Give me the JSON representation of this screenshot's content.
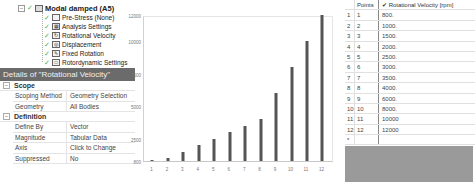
{
  "tree": {
    "root": {
      "label": "Modal damped (A5)",
      "icon": "folder-icon"
    },
    "items": [
      {
        "label": "Pre-Stress (None)",
        "icon": "prestress-icon"
      },
      {
        "label": "Analysis Settings",
        "icon": "analysis-settings-icon"
      },
      {
        "label": "Rotational Velocity",
        "icon": "rotational-velocity-icon"
      },
      {
        "label": "Displacement",
        "icon": "displacement-icon"
      },
      {
        "label": "Fixed Rotation",
        "icon": "fixed-rotation-icon"
      },
      {
        "label": "Rotordynamic Settings",
        "icon": "rotordynamic-settings-icon"
      }
    ]
  },
  "details": {
    "title": "Details of \"Rotational Velocity\"",
    "groups": [
      {
        "label": "Scope",
        "rows": [
          {
            "key": "Scoping Method",
            "value": "Geometry Selection"
          },
          {
            "key": "Geometry",
            "value": "All Bodies"
          }
        ]
      },
      {
        "label": "Definition",
        "rows": [
          {
            "key": "Define By",
            "value": "Vector"
          },
          {
            "key": "Magnitude",
            "value": "Tabular Data"
          },
          {
            "key": "Axis",
            "value": "Click to Change"
          },
          {
            "key": "Suppressed",
            "value": "No"
          }
        ]
      }
    ]
  },
  "chart_data": {
    "type": "bar",
    "title": "",
    "xlabel": "",
    "ylabel": "",
    "categories": [
      "1",
      "2",
      "3",
      "4",
      "5",
      "6",
      "7",
      "8",
      "9",
      "10",
      "11",
      "12"
    ],
    "values": [
      800,
      1000,
      1500,
      2000,
      2500,
      3000,
      3500,
      4000,
      6000,
      8000,
      10000,
      12000
    ],
    "yticks": [
      "12000",
      "10000",
      "7500",
      "5000",
      "2500",
      "800"
    ],
    "ylim": [
      800,
      12000
    ],
    "grid": false,
    "bar_color": "#555555"
  },
  "table": {
    "headers": [
      "",
      "Points",
      "✔ Rotational Velocity [rpm]"
    ],
    "rows": [
      [
        "1",
        "1",
        "800."
      ],
      [
        "2",
        "2",
        "1000."
      ],
      [
        "3",
        "3",
        "1500."
      ],
      [
        "4",
        "4",
        "2000."
      ],
      [
        "5",
        "5",
        "2500."
      ],
      [
        "6",
        "6",
        "3000."
      ],
      [
        "7",
        "7",
        "3500."
      ],
      [
        "8",
        "8",
        "4000."
      ],
      [
        "9",
        "9",
        "6000."
      ],
      [
        "10",
        "10",
        "8000."
      ],
      [
        "11",
        "11",
        "10000"
      ],
      [
        "12",
        "12",
        "12000"
      ]
    ],
    "new_row_marker": "*"
  }
}
